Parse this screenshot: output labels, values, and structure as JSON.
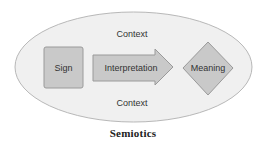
{
  "diagram": {
    "context_top": "Context",
    "context_bottom": "Context",
    "sign": "Sign",
    "interpretation": "Interpretation",
    "meaning": "Meaning",
    "caption": "Semiotics"
  },
  "colors": {
    "ellipse_fill": "#f0f0f0",
    "ellipse_stroke": "#b8b8b8",
    "shape_fill": "#c9c9c9",
    "shape_stroke": "#9a9a9a",
    "text": "#333333"
  }
}
